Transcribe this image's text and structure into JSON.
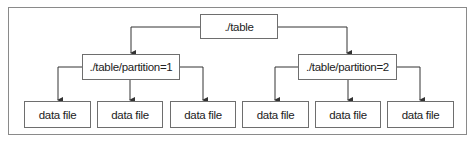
{
  "diagram": {
    "type": "tree",
    "root": {
      "label": "./table"
    },
    "partitions": [
      {
        "label": "./table/partition=1",
        "children": [
          "data file",
          "data file",
          "data file"
        ]
      },
      {
        "label": "./table/partition=2",
        "children": [
          "data file",
          "data file",
          "data file"
        ]
      }
    ]
  },
  "colors": {
    "line": "#333333",
    "border": "#6e6e6e",
    "frame": "#8a8a8a"
  }
}
